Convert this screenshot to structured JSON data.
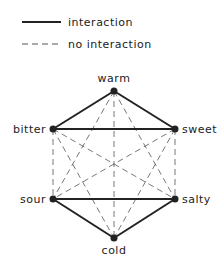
{
  "legend": {
    "solid_label": "interaction",
    "dashed_label": "no interaction"
  },
  "nodes": [
    {
      "id": "warm",
      "label": "warm",
      "x": 114,
      "y": 91,
      "lx": 114,
      "ly": 82,
      "anchor": "middle"
    },
    {
      "id": "bitter",
      "label": "bitter",
      "x": 53,
      "y": 129,
      "lx": 46,
      "ly": 133,
      "anchor": "end"
    },
    {
      "id": "sweet",
      "label": "sweet",
      "x": 175,
      "y": 129,
      "lx": 182,
      "ly": 133,
      "anchor": "start"
    },
    {
      "id": "sour",
      "label": "sour",
      "x": 53,
      "y": 199,
      "lx": 46,
      "ly": 203,
      "anchor": "end"
    },
    {
      "id": "salty",
      "label": "salty",
      "x": 175,
      "y": 199,
      "lx": 182,
      "ly": 203,
      "anchor": "start"
    },
    {
      "id": "cold",
      "label": "cold",
      "x": 114,
      "y": 238,
      "lx": 114,
      "ly": 254,
      "anchor": "middle"
    }
  ],
  "edges": {
    "interaction": [
      [
        "warm",
        "bitter"
      ],
      [
        "warm",
        "sweet"
      ],
      [
        "bitter",
        "sweet"
      ],
      [
        "sour",
        "salty"
      ],
      [
        "sour",
        "cold"
      ],
      [
        "salty",
        "cold"
      ]
    ],
    "no_interaction": [
      [
        "warm",
        "sour"
      ],
      [
        "warm",
        "salty"
      ],
      [
        "warm",
        "cold"
      ],
      [
        "bitter",
        "sour"
      ],
      [
        "bitter",
        "salty"
      ],
      [
        "bitter",
        "cold"
      ],
      [
        "sweet",
        "sour"
      ],
      [
        "sweet",
        "salty"
      ],
      [
        "sweet",
        "cold"
      ]
    ]
  },
  "colors": {
    "line": "#222222",
    "dashed": "#555555"
  }
}
